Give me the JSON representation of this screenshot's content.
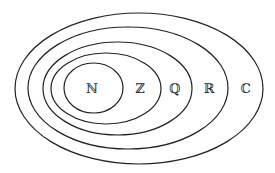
{
  "diagram": {
    "stroke_color": "#222222",
    "sets": [
      {
        "id": "complex",
        "label": "ℂ",
        "cx": 139,
        "cy": 88.5,
        "rx": 124,
        "ry": 75.5,
        "label_x": 246,
        "label_y": 93
      },
      {
        "id": "real",
        "label": "ℝ",
        "cx": 128,
        "cy": 88,
        "rx": 100,
        "ry": 61,
        "label_x": 209,
        "label_y": 93
      },
      {
        "id": "rational",
        "label": "ℚ",
        "cx": 117.5,
        "cy": 88.5,
        "rx": 74.5,
        "ry": 46.5,
        "label_x": 175,
        "label_y": 93
      },
      {
        "id": "integer",
        "label": "ℤ",
        "cx": 106,
        "cy": 88.5,
        "rx": 55,
        "ry": 35.5,
        "label_x": 140,
        "label_y": 93
      },
      {
        "id": "natural",
        "label": "ℕ",
        "cx": 93.5,
        "cy": 88,
        "rx": 29.5,
        "ry": 25,
        "label_x": 92,
        "label_y": 93
      }
    ]
  }
}
